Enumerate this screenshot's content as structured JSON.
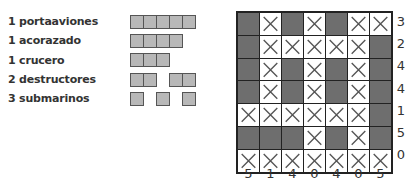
{
  "fleet": [
    {
      "label": "1 portaaviones",
      "ships": [
        {
          "length": 5,
          "offset": 0
        }
      ]
    },
    {
      "label": "1 acorazado",
      "ships": [
        {
          "length": 4,
          "offset": 0
        }
      ]
    },
    {
      "label": "1 crucero",
      "ships": [
        {
          "length": 3,
          "offset": 0
        }
      ]
    },
    {
      "label": "2 destructores",
      "ships": [
        {
          "length": 2,
          "offset": 0
        },
        {
          "length": 2,
          "offset": 39
        }
      ]
    },
    {
      "label": "3 submarinos",
      "ships": [
        {
          "length": 1,
          "offset": 0
        },
        {
          "length": 1,
          "offset": 26
        },
        {
          "length": 1,
          "offset": 52
        }
      ]
    }
  ],
  "grid": {
    "rows": 7,
    "cols": 7,
    "cells": [
      [
        "S",
        "W",
        "S",
        "W",
        "S",
        "W",
        "W"
      ],
      [
        "S",
        "W",
        "W",
        "W",
        "W",
        "W",
        "S"
      ],
      [
        "S",
        "W",
        "S",
        "W",
        "S",
        "W",
        "S"
      ],
      [
        "S",
        "W",
        "S",
        "W",
        "S",
        "W",
        "S"
      ],
      [
        "W",
        "W",
        "W",
        "W",
        "W",
        "W",
        "S"
      ],
      [
        "S",
        "S",
        "S",
        "W",
        "S",
        "W",
        "S"
      ],
      [
        "W",
        "W",
        "W",
        "W",
        "W",
        "W",
        "W"
      ]
    ],
    "legend": {
      "S": "ship-segment (filled gray)",
      "W": "water (x-mark)"
    },
    "row_clues": [
      "3",
      "2",
      "4",
      "4",
      "1",
      "5",
      "0"
    ],
    "col_clues": [
      "5",
      "1",
      "4",
      "0",
      "4",
      "0",
      "5"
    ]
  },
  "colors": {
    "ship": "#6e6e6e",
    "ship_legend": "#b8b8b8",
    "grid_line": "#222222"
  }
}
